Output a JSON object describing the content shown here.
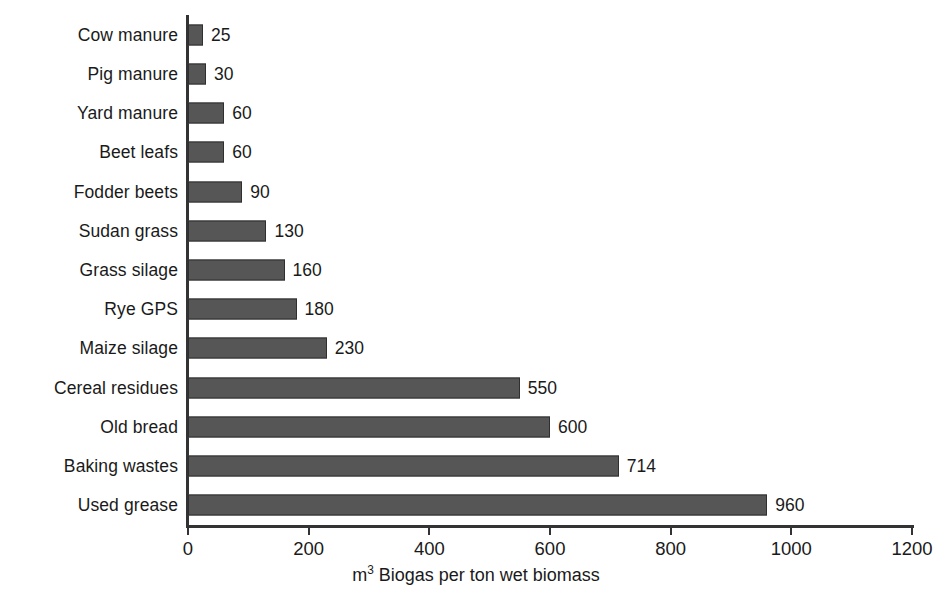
{
  "chart_data": {
    "type": "bar",
    "orientation": "horizontal",
    "title": "",
    "subtitle": "",
    "xlabel": "m³ Biogas per ton wet biomass",
    "xlabel_prefix": "m",
    "xlabel_superscript": "3",
    "xlabel_rest": " Biogas per ton wet biomass",
    "ylabel": "",
    "categories": [
      "Cow manure",
      "Pig manure",
      "Yard manure",
      "Beet leafs",
      "Fodder beets",
      "Sudan grass",
      "Grass silage",
      "Rye GPS",
      "Maize silage",
      "Cereal residues",
      "Old bread",
      "Baking wastes",
      "Used grease"
    ],
    "values": [
      25,
      30,
      60,
      60,
      90,
      130,
      160,
      180,
      230,
      550,
      600,
      714,
      960
    ],
    "value_labels": [
      "25",
      "30",
      "60",
      "60",
      "90",
      "130",
      "160",
      "180",
      "230",
      "550",
      "600",
      "714",
      "960"
    ],
    "xlim": [
      0,
      1200
    ],
    "xticks": [
      0,
      200,
      400,
      600,
      800,
      1000,
      1200
    ],
    "xtick_labels": [
      "0",
      "200",
      "400",
      "600",
      "800",
      "1000",
      "1200"
    ],
    "grid": false,
    "legend": null,
    "legend_position": "none",
    "bar_color": "#565656",
    "bar_edge_color": "#2f2f2f",
    "axis_color": "#333333",
    "text_color": "#1a1a1a",
    "background_color": "#ffffff"
  }
}
